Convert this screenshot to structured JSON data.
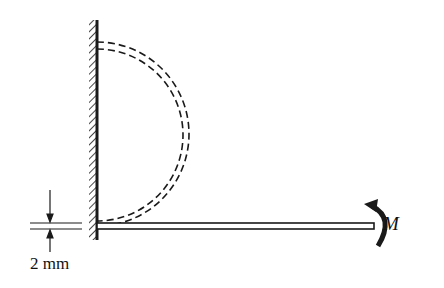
{
  "diagram": {
    "labels": {
      "moment": "M",
      "thickness": "2 mm"
    },
    "elements": [
      {
        "name": "wall",
        "type": "fixed-support-hatched"
      },
      {
        "name": "beam",
        "type": "straight-beam"
      },
      {
        "name": "deformed-beam",
        "type": "dashed-semicircle"
      },
      {
        "name": "moment-arrow",
        "type": "curved-arrow"
      },
      {
        "name": "thickness-dimension",
        "type": "dimension-arrows"
      }
    ],
    "colors": {
      "ink": "#1a1a1a",
      "background": "#ffffff"
    }
  }
}
